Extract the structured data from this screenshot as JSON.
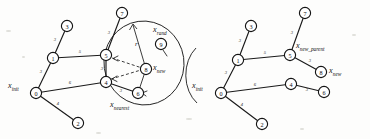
{
  "figure": {
    "background_color": "#fdfdfc",
    "ink_color": "#141414",
    "panels": [
      {
        "id": "left",
        "name": "sampling-step",
        "caption": "",
        "nodes": [
          {
            "id": "0",
            "label": "0",
            "x": 36,
            "y": 93
          },
          {
            "id": "1",
            "label": "1",
            "x": 53,
            "y": 58
          },
          {
            "id": "2",
            "label": "2",
            "x": 78,
            "y": 123
          },
          {
            "id": "3",
            "label": "3",
            "x": 67,
            "y": 26
          },
          {
            "id": "4",
            "label": "4",
            "x": 106,
            "y": 82
          },
          {
            "id": "5",
            "label": "5",
            "x": 106,
            "y": 55
          },
          {
            "id": "6",
            "label": "6",
            "x": 138,
            "y": 93
          },
          {
            "id": "7",
            "label": "7",
            "x": 122,
            "y": 13
          },
          {
            "id": "8",
            "label": "8",
            "x": 146,
            "y": 69
          },
          {
            "id": "9",
            "label": "9",
            "x": 161,
            "y": 44
          }
        ],
        "edges": [
          {
            "from": "0",
            "to": "1",
            "weight": "3"
          },
          {
            "from": "0",
            "to": "2",
            "weight": "4"
          },
          {
            "from": "0",
            "to": "4",
            "weight": "6"
          },
          {
            "from": "1",
            "to": "3",
            "weight": "3"
          },
          {
            "from": "1",
            "to": "5",
            "weight": "5"
          },
          {
            "from": "4",
            "to": "5",
            "weight": "3"
          },
          {
            "from": "4",
            "to": "6",
            "weight": "3"
          },
          {
            "from": "5",
            "to": "7",
            "weight": "3"
          }
        ],
        "candidate_edges": [
          {
            "from": "6",
            "to": "8",
            "style": "solid"
          },
          {
            "from": "5",
            "to": "8",
            "style": "dashed"
          },
          {
            "from": "4",
            "to": "8",
            "style": "dashed"
          }
        ],
        "region": {
          "name": "near-radius-ellipse",
          "cx": 144,
          "cy": 63,
          "rx": 40,
          "ry": 42,
          "rotation": -8
        },
        "radius_arrow": {
          "label": "r",
          "from_x": 146,
          "from_y": 69,
          "to_x": 133,
          "to_y": 24
        },
        "labels": [
          {
            "name": "x-init",
            "text": "x",
            "sub": "init",
            "x": 8,
            "y": 84
          },
          {
            "name": "x-rand",
            "text": "x",
            "sub": "rand",
            "x": 154,
            "y": 28
          },
          {
            "name": "x-new",
            "text": "x",
            "sub": "new",
            "x": 152,
            "y": 64
          },
          {
            "name": "x-nearest",
            "text": "x",
            "sub": "nearest",
            "x": 111,
            "y": 103
          }
        ]
      },
      {
        "id": "right",
        "name": "rewired-tree",
        "caption": "",
        "nodes": [
          {
            "id": "0",
            "label": "0",
            "x": 221,
            "y": 93
          },
          {
            "id": "1",
            "label": "1",
            "x": 238,
            "y": 60
          },
          {
            "id": "2",
            "label": "2",
            "x": 262,
            "y": 124
          },
          {
            "id": "3",
            "label": "3",
            "x": 251,
            "y": 26
          },
          {
            "id": "4",
            "label": "4",
            "x": 291,
            "y": 84
          },
          {
            "id": "5",
            "label": "5",
            "x": 290,
            "y": 55
          },
          {
            "id": "6",
            "label": "6",
            "x": 324,
            "y": 92
          },
          {
            "id": "7",
            "label": "7",
            "x": 305,
            "y": 13
          },
          {
            "id": "8",
            "label": "8",
            "x": 321,
            "y": 72
          }
        ],
        "edges": [
          {
            "from": "0",
            "to": "1",
            "weight": "3"
          },
          {
            "from": "0",
            "to": "2",
            "weight": "4"
          },
          {
            "from": "0",
            "to": "4",
            "weight": "6"
          },
          {
            "from": "1",
            "to": "3",
            "weight": "3"
          },
          {
            "from": "1",
            "to": "5",
            "weight": "5"
          },
          {
            "from": "4",
            "to": "6",
            "weight": "3"
          },
          {
            "from": "5",
            "to": "7",
            "weight": "3"
          },
          {
            "from": "5",
            "to": "8",
            "weight": "3"
          }
        ],
        "candidate_edges": [],
        "region": null,
        "radius_arrow": null,
        "labels": [
          {
            "name": "x-init",
            "text": "x",
            "sub": "init",
            "x": 193,
            "y": 84
          },
          {
            "name": "x-new-parent",
            "text": "x",
            "sub": "new_parent",
            "x": 297,
            "y": 44
          },
          {
            "name": "x-new",
            "text": "x",
            "sub": "new",
            "x": 330,
            "y": 68
          }
        ]
      }
    ]
  }
}
